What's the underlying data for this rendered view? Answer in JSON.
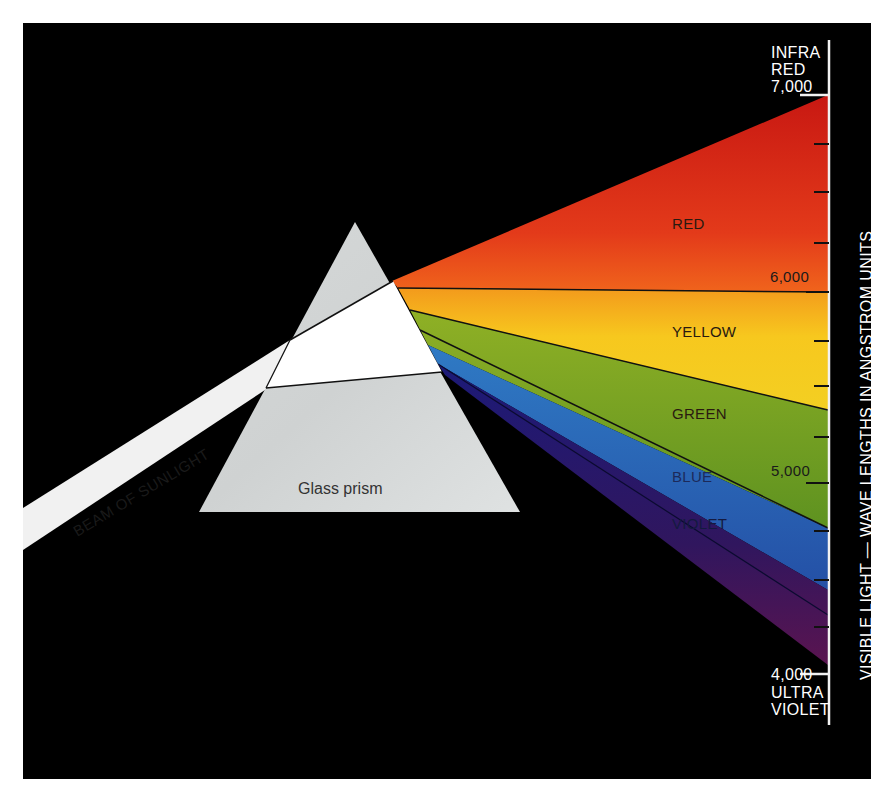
{
  "diagram": {
    "background_color": "#000000",
    "beam": {
      "label": "BEAM OF SUNLIGHT",
      "color": "#f2f2f2"
    },
    "prism": {
      "label": "Glass prism",
      "color": "#d9dcdc"
    },
    "spectrum": {
      "bands": [
        {
          "name": "RED",
          "color": "#e0301e"
        },
        {
          "name": "YELLOW",
          "color": "#f6c21c"
        },
        {
          "name": "GREEN",
          "color": "#6f9f22"
        },
        {
          "name": "BLUE",
          "color": "#2a66b8"
        },
        {
          "name": "VIOLET",
          "color": "#2a1a6e"
        }
      ]
    },
    "scale": {
      "axis_label": "VISIBLE LIGHT — WAVE LENGTHS IN ANGSTROM UNITS",
      "top_label_line1": "INFRA",
      "top_label_line2": "RED",
      "bottom_label_line1": "ULTRA",
      "bottom_label_line2": "VIOLET",
      "ticks": [
        "7,000",
        "6,000",
        "5,000",
        "4,000"
      ]
    }
  }
}
